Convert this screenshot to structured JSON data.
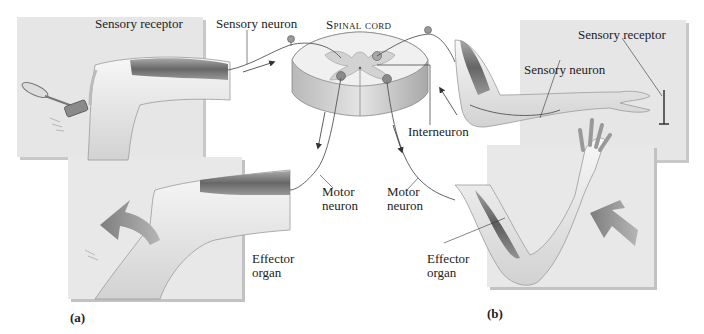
{
  "figure": {
    "center_label": "Spinal cord",
    "panels": [
      {
        "id": "a",
        "caption": "(a)",
        "labels": {
          "sensory_receptor": "Sensory receptor",
          "sensory_neuron": "Sensory neuron",
          "motor_neuron_line1": "Motor",
          "motor_neuron_line2": "neuron",
          "effector_line1": "Effector",
          "effector_line2": "organ"
        }
      },
      {
        "id": "b",
        "caption": "(b)",
        "labels": {
          "sensory_receptor": "Sensory receptor",
          "sensory_neuron": "Sensory neuron",
          "interneuron": "Interneuron",
          "motor_neuron_line1": "Motor",
          "motor_neuron_line2": "neuron",
          "effector_line1": "Effector",
          "effector_line2": "organ"
        }
      }
    ],
    "colors": {
      "panel_bg": "#e6e6e6",
      "panel_shadow": "#bdbdbd",
      "skin": "#efefef",
      "muscle": "#6a6a6a",
      "cord_gray": "#cfcfcf",
      "arrow": "#8a8a8a",
      "line": "#333333"
    }
  }
}
